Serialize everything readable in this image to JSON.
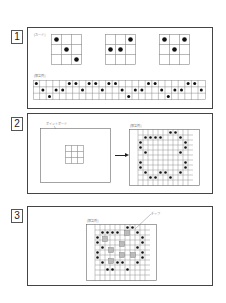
{
  "steps": [
    {
      "number": "1",
      "card_label": "[カード]",
      "example_label": "[解答例]"
    },
    {
      "number": "2",
      "board_label": "ポイントボード",
      "example_label": "[解答例]",
      "arrow": "→"
    },
    {
      "number": "3",
      "example_label": "[解答例]",
      "chip_label": "チップ"
    }
  ],
  "colors": {
    "border": "#444444",
    "grid": "#888888",
    "dot": "#111111",
    "chip": "#bbbbbb"
  }
}
